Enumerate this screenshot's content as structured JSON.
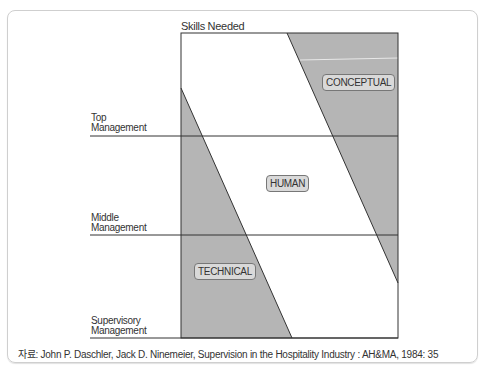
{
  "diagram": {
    "title": "Skills Needed",
    "levels": [
      {
        "line1": "Top",
        "line2": "Management"
      },
      {
        "line1": "Middle",
        "line2": "Management"
      },
      {
        "line1": "Supervisory",
        "line2": "Management"
      }
    ],
    "regions": {
      "conceptual": "CONCEPTUAL",
      "human": "HUMAN",
      "technical": "TECHNICAL"
    },
    "colors": {
      "shade": "#b5b5b5",
      "line": "#333333",
      "tag_bg": "#d9d9d9"
    }
  },
  "source": "자료: John P. Daschler, Jack D. Ninemeier, Supervision in the Hospitality Industry : AH&MA, 1984: 35"
}
